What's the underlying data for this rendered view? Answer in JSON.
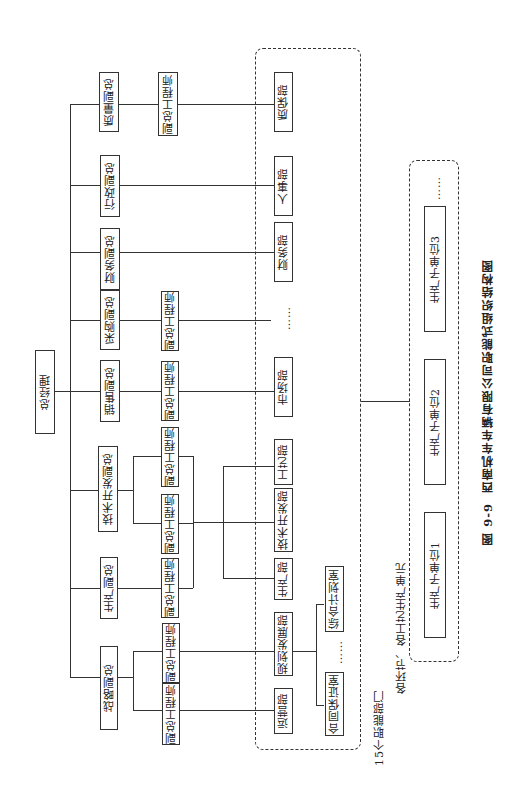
{
  "figure": {
    "caption_number": "图 9-9",
    "caption_title": "西南机车车辆有限公司职能式组织结构图"
  },
  "root": {
    "label": "总经理"
  },
  "vice_presidents": [
    {
      "label": "质量副总"
    },
    {
      "label": "行政副总"
    },
    {
      "label": "财务副总"
    },
    {
      "label": "采购副总"
    },
    {
      "label": "销售副总"
    },
    {
      "label": "技术开发副总"
    },
    {
      "label": "生产副总"
    },
    {
      "label": "战略副总"
    }
  ],
  "engineers": {
    "quality": "副总工程师",
    "purchase": "副总工程师",
    "sales": "副总工程师",
    "tech_1": "副总工程师",
    "tech_2": "副总工程师",
    "production": "副总工程师",
    "strategy_1": "副总工程师",
    "strategy_2": "副总工程师"
  },
  "departments": {
    "group_label": "15个职能部门",
    "items": [
      {
        "label": "质保部"
      },
      {
        "label": "人事部"
      },
      {
        "label": "财务部"
      },
      {
        "label": "……"
      },
      {
        "label": "市场部"
      },
      {
        "label": "工艺部"
      },
      {
        "label": "技术开发部"
      },
      {
        "label": "生产部"
      },
      {
        "label": "规划发展部"
      },
      {
        "label": "运营部"
      }
    ],
    "sub_offices": [
      {
        "label": "综合计划室"
      },
      {
        "label": "……"
      },
      {
        "label": "合同保证室"
      }
    ]
  },
  "production_units": {
    "group_label": "各环节、各工艺生产单元",
    "items": [
      {
        "label": "……"
      },
      {
        "label": "生产子单位3"
      },
      {
        "label": "生产子单位2"
      },
      {
        "label": "生产子单位1"
      }
    ]
  }
}
